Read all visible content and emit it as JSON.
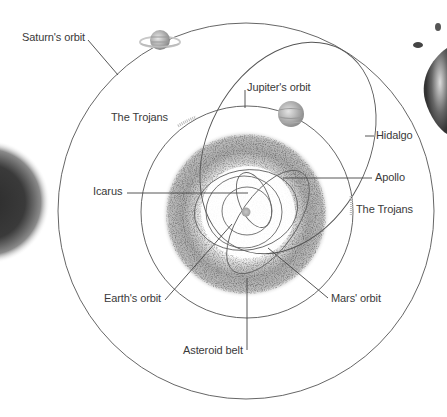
{
  "diagram": {
    "colors": {
      "line": "#555555",
      "leader": "#444444",
      "belt": "#b8b8b8",
      "text": "#3a3a3a"
    },
    "labels": {
      "saturn_orbit": "Saturn's orbit",
      "jupiter_orbit": "Jupiter's orbit",
      "trojans_left": "The Trojans",
      "trojans_right": "The Trojans",
      "hidalgo": "Hidalgo",
      "icarus": "Icarus",
      "apollo": "Apollo",
      "earth_orbit": "Earth's orbit",
      "mars_orbit": "Mars' orbit",
      "asteroid_belt": "Asteroid belt"
    },
    "bodies": [
      "Sun",
      "Jupiter",
      "Saturn"
    ],
    "icons": {
      "sun": "sun-icon",
      "jupiter": "jupiter-planet-icon",
      "saturn": "saturn-planet-icon"
    }
  }
}
